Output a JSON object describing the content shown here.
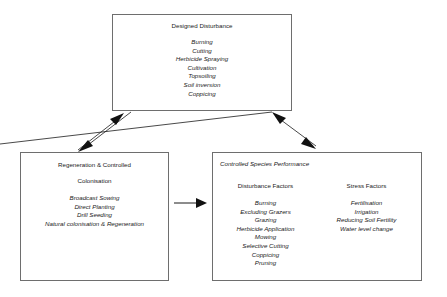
{
  "diagram": {
    "title": "Designed Disturbance",
    "boxes": {
      "designed_disturbance": {
        "title": "Designed Disturbance",
        "items": [
          "Burning",
          "Cutting",
          "Herbicide Spraying",
          "Cultivation",
          "Topsoiling",
          "Soil inversion",
          "Coppicing"
        ]
      },
      "regeneration": {
        "title_line1": "Regeneration & Controlled",
        "title_line2": "Colonisation",
        "items": [
          "Broadcast Sowing",
          "Direct Planting",
          "Drill Seeding",
          "Natural colonisation & Regeneration"
        ]
      },
      "controlled_species_performance": {
        "title": "Controlled Species Performance",
        "columns": [
          {
            "heading": "Disturbance Factors",
            "items": [
              "Burning",
              "Excluding Grazers",
              "Grazing",
              "Herbicide Application",
              "Mowing",
              "Selective Cutting",
              "Coppicing",
              "Pruning"
            ]
          },
          {
            "heading": "Stress Factors",
            "items": [
              "Fertilisation",
              "Irrigation",
              "Reducing Soil Fertility",
              "Water level change"
            ]
          }
        ]
      }
    },
    "connectors": [
      {
        "name": "designed-disturbance-to-regeneration",
        "direction": "down-left"
      },
      {
        "name": "regeneration-to-designed-disturbance",
        "direction": "up-right"
      },
      {
        "name": "designed-disturbance-to-controlled-species",
        "direction": "down-right"
      },
      {
        "name": "controlled-species-to-designed-disturbance",
        "direction": "up-left"
      },
      {
        "name": "regeneration-to-controlled-species",
        "direction": "right"
      }
    ],
    "colors": {
      "background": "#ffffff",
      "box_border": "#6e6e6e",
      "text": "#1a1a1a",
      "connector": "#1a1a1a"
    }
  }
}
